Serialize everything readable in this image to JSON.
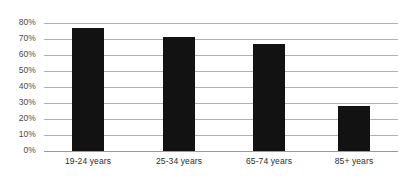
{
  "chart_data": {
    "type": "bar",
    "title": "",
    "subtitle": "",
    "xlabel": "",
    "ylabel": "",
    "categories": [
      "19-24 years",
      "25-34 years",
      "65-74 years",
      "85+ years"
    ],
    "values": [
      77,
      71,
      67,
      28
    ],
    "value_labels": [
      "77%",
      "71%",
      "67%",
      "28%"
    ],
    "ylim": [
      0,
      80
    ],
    "y_ticks": [
      0,
      10,
      20,
      30,
      40,
      50,
      60,
      70,
      80
    ],
    "y_tick_labels": [
      "0%",
      "10%",
      "20%",
      "30%",
      "40%",
      "50%",
      "60%",
      "70%",
      "80%"
    ],
    "grid": true,
    "grid_axis": "y",
    "legend": false,
    "legend_position": "none",
    "bar_color": "#121212",
    "gridline_color": "#b0b0b0",
    "axis_text_color": "#4a4a4a",
    "background_color": "#ffffff",
    "series": [
      {
        "name": "",
        "values": [
          77,
          71,
          67,
          28
        ]
      }
    ]
  }
}
